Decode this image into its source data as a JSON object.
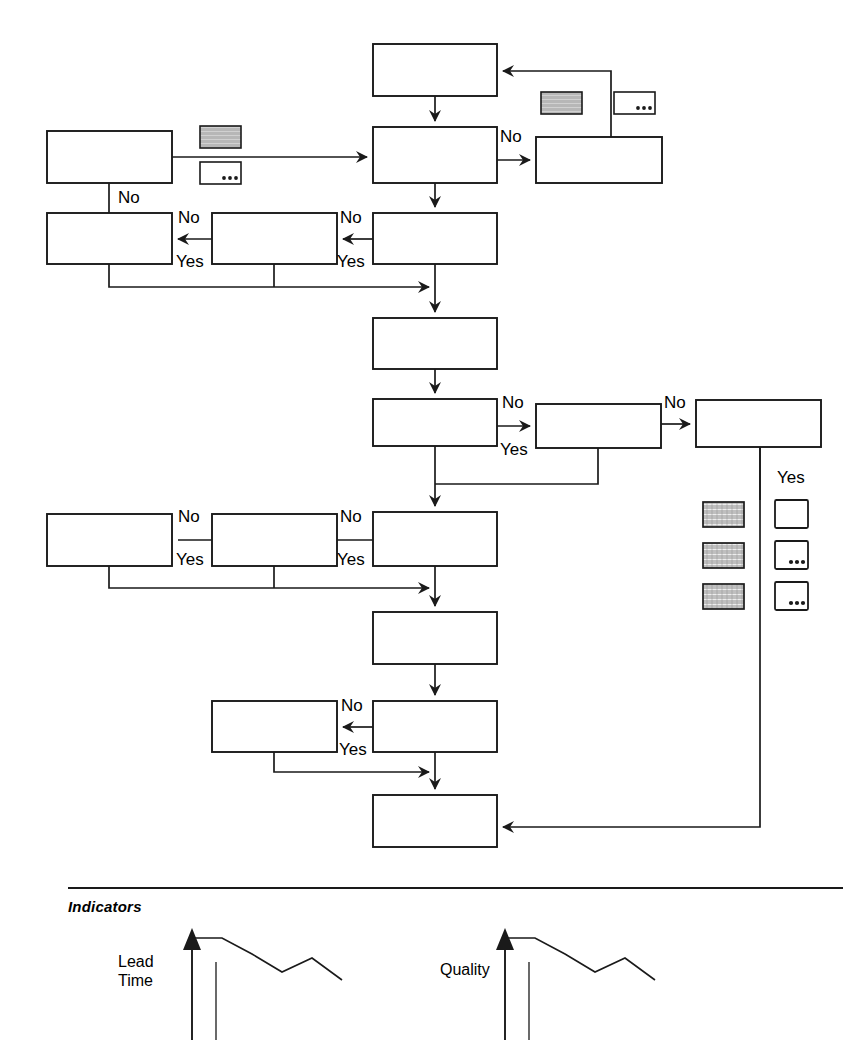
{
  "diagram": {
    "stroke_color": "#1a1a1a",
    "background_color": "#ffffff",
    "edge_labels": {
      "no": "No",
      "yes": "Yes"
    },
    "process_boxes": [
      {
        "id": "box-top-main",
        "x": 373,
        "y": 44,
        "w": 124,
        "h": 52
      },
      {
        "id": "box-left-top",
        "x": 47,
        "y": 131,
        "w": 125,
        "h": 52
      },
      {
        "id": "box-main-2",
        "x": 373,
        "y": 127,
        "w": 124,
        "h": 56
      },
      {
        "id": "box-right-top",
        "x": 536,
        "y": 137,
        "w": 126,
        "h": 46
      },
      {
        "id": "box-row2-left",
        "x": 47,
        "y": 213,
        "w": 125,
        "h": 51
      },
      {
        "id": "box-row2-mid",
        "x": 212,
        "y": 213,
        "w": 125,
        "h": 51
      },
      {
        "id": "box-main-3",
        "x": 373,
        "y": 213,
        "w": 124,
        "h": 51
      },
      {
        "id": "box-main-4",
        "x": 373,
        "y": 318,
        "w": 124,
        "h": 51
      },
      {
        "id": "box-main-5",
        "x": 373,
        "y": 399,
        "w": 124,
        "h": 47
      },
      {
        "id": "box-mid-right-1",
        "x": 536,
        "y": 404,
        "w": 125,
        "h": 44
      },
      {
        "id": "box-far-right",
        "x": 696,
        "y": 400,
        "w": 125,
        "h": 47
      },
      {
        "id": "box-row5-left",
        "x": 47,
        "y": 514,
        "w": 125,
        "h": 52
      },
      {
        "id": "box-row5-mid",
        "x": 212,
        "y": 514,
        "w": 125,
        "h": 52
      },
      {
        "id": "box-main-6",
        "x": 373,
        "y": 512,
        "w": 124,
        "h": 54
      },
      {
        "id": "box-main-7",
        "x": 373,
        "y": 612,
        "w": 124,
        "h": 52
      },
      {
        "id": "box-row7-left",
        "x": 212,
        "y": 701,
        "w": 125,
        "h": 51
      },
      {
        "id": "box-main-8",
        "x": 373,
        "y": 701,
        "w": 124,
        "h": 51
      },
      {
        "id": "box-main-9",
        "x": 373,
        "y": 795,
        "w": 124,
        "h": 52
      }
    ],
    "note_icons": [
      {
        "id": "note-hatched-top-left",
        "x": 200,
        "y": 126,
        "w": 41,
        "h": 22,
        "style": "hatched"
      },
      {
        "id": "note-ellipsis-top-left",
        "x": 200,
        "y": 162,
        "w": 41,
        "h": 22,
        "style": "ellipsis"
      },
      {
        "id": "note-hatched-top-right",
        "x": 541,
        "y": 92,
        "w": 41,
        "h": 22,
        "style": "hatched"
      },
      {
        "id": "note-ellipsis-top-right",
        "x": 614,
        "y": 92,
        "w": 41,
        "h": 22,
        "style": "ellipsis"
      }
    ],
    "legend": {
      "yes_label": "Yes",
      "yes_label_x": 777,
      "yes_label_y": 468,
      "hatched_column": [
        {
          "id": "legend-hatched-1",
          "x": 703,
          "y": 502,
          "w": 41,
          "h": 25
        },
        {
          "id": "legend-hatched-2",
          "x": 703,
          "y": 543,
          "w": 41,
          "h": 25
        },
        {
          "id": "legend-hatched-3",
          "x": 703,
          "y": 584,
          "w": 41,
          "h": 25
        }
      ],
      "plain_column": [
        {
          "id": "legend-plain-1",
          "x": 775,
          "y": 500,
          "w": 33,
          "h": 28,
          "style": "plain"
        },
        {
          "id": "legend-ellipsis-2",
          "x": 775,
          "y": 541,
          "w": 33,
          "h": 28,
          "style": "ellipsis"
        },
        {
          "id": "legend-ellipsis-3",
          "x": 775,
          "y": 582,
          "w": 33,
          "h": 28,
          "style": "ellipsis"
        }
      ]
    },
    "decision_labels": [
      {
        "id": "label-no-r1-left",
        "text": "No",
        "x": 118,
        "y": 188
      },
      {
        "id": "label-no-r1-right",
        "text": "No",
        "x": 500,
        "y": 127
      },
      {
        "id": "label-no-r2-mid",
        "text": "No",
        "x": 178,
        "y": 208
      },
      {
        "id": "label-yes-r2-mid",
        "text": "Yes",
        "x": 176,
        "y": 252
      },
      {
        "id": "label-no-r2-right",
        "text": "No",
        "x": 340,
        "y": 208
      },
      {
        "id": "label-yes-r2-right",
        "text": "Yes",
        "x": 337,
        "y": 252
      },
      {
        "id": "label-no-r4-mid",
        "text": "No",
        "x": 502,
        "y": 393
      },
      {
        "id": "label-yes-r4-mid",
        "text": "Yes",
        "x": 500,
        "y": 440
      },
      {
        "id": "label-no-r4-right",
        "text": "No",
        "x": 664,
        "y": 393
      },
      {
        "id": "label-no-r5-mid",
        "text": "No",
        "x": 178,
        "y": 507
      },
      {
        "id": "label-yes-r5-mid",
        "text": "Yes",
        "x": 176,
        "y": 550
      },
      {
        "id": "label-no-r5-right",
        "text": "No",
        "x": 340,
        "y": 507
      },
      {
        "id": "label-yes-r5-right",
        "text": "Yes",
        "x": 337,
        "y": 550
      },
      {
        "id": "label-no-r7",
        "text": "No",
        "x": 341,
        "y": 696
      },
      {
        "id": "label-yes-r7",
        "text": "Yes",
        "x": 339,
        "y": 740
      }
    ]
  },
  "indicators": {
    "section_label": "Indicators",
    "divider_y": 888,
    "charts": [
      {
        "id": "indicator-lead-time",
        "label_lines": [
          "Lead",
          "Time"
        ],
        "label_x": 118,
        "label_y": 952,
        "axis_x": 192,
        "axis_top_y": 928,
        "chart_data": {
          "type": "line",
          "title": "Lead Time",
          "xlabel": "",
          "ylabel": "Lead Time",
          "x": [
            0,
            1,
            2,
            3,
            4,
            5
          ],
          "values": [
            72,
            72,
            56,
            38,
            52,
            30
          ],
          "grid": false,
          "legend": "none"
        }
      },
      {
        "id": "indicator-quality",
        "label_lines": [
          "Quality"
        ],
        "label_x": 440,
        "label_y": 960,
        "axis_x": 505,
        "axis_top_y": 928,
        "chart_data": {
          "type": "line",
          "title": "Quality",
          "xlabel": "",
          "ylabel": "Quality",
          "x": [
            0,
            1,
            2,
            3,
            4,
            5
          ],
          "values": [
            72,
            72,
            56,
            38,
            52,
            30
          ],
          "grid": false,
          "legend": "none"
        }
      }
    ]
  }
}
